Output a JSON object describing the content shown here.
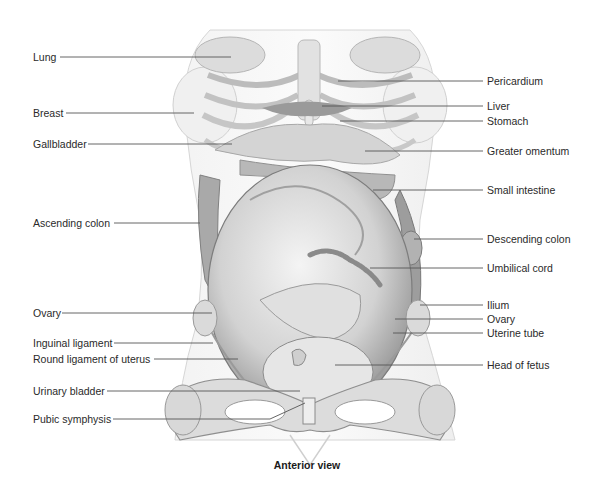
{
  "figure": {
    "caption": "Anterior view",
    "colors": {
      "leader_line": "#555555",
      "background": "#ffffff",
      "tissue_light": "#e6e6e6",
      "tissue_mid": "#bdbdbd",
      "tissue_dark": "#8a8a8a"
    }
  },
  "labels_left": [
    {
      "text": "Lung",
      "y": 57
    },
    {
      "text": "Breast",
      "y": 113
    },
    {
      "text": "Gallbladder",
      "y": 144
    },
    {
      "text": "Ascending colon",
      "y": 223
    },
    {
      "text": "Ovary",
      "y": 313
    },
    {
      "text": "Inguinal ligament",
      "y": 343
    },
    {
      "text": "Round ligament of uterus",
      "y": 359
    },
    {
      "text": "Urinary bladder",
      "y": 391
    },
    {
      "text": "Pubic symphysis",
      "y": 419
    }
  ],
  "labels_right": [
    {
      "text": "Pericardium",
      "y": 81
    },
    {
      "text": "Liver",
      "y": 106
    },
    {
      "text": "Stomach",
      "y": 121
    },
    {
      "text": "Greater omentum",
      "y": 151
    },
    {
      "text": "Small intestine",
      "y": 190
    },
    {
      "text": "Descending colon",
      "y": 239
    },
    {
      "text": "Umbilical cord",
      "y": 268
    },
    {
      "text": "Ilium",
      "y": 305
    },
    {
      "text": "Ovary",
      "y": 319
    },
    {
      "text": "Uterine tube",
      "y": 333
    },
    {
      "text": "Head of fetus",
      "y": 365
    }
  ]
}
